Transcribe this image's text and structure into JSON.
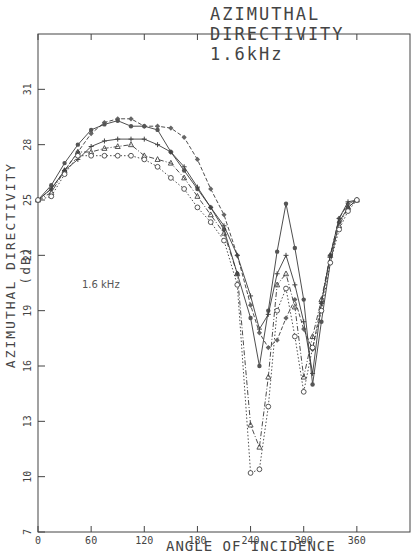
{
  "chart_data": {
    "type": "line",
    "title": "AZIMUTHAL DIRECTIVITY 1.6kHz",
    "xlabel": "ANGLE OF INCIDENCE",
    "ylabel": "AZIMUTHAL DIRECTIVITY (dB)",
    "annotation": "1.6 kHz",
    "xlim": [
      0,
      420
    ],
    "ylim": [
      7,
      34
    ],
    "x_ticks": [
      0,
      60,
      120,
      180,
      240,
      300,
      360
    ],
    "x_tick_labels": [
      "0",
      "60",
      "120",
      "180",
      "240",
      "300",
      "360"
    ],
    "y_ticks": [
      7,
      10,
      13,
      16,
      19,
      22,
      25,
      28,
      31
    ],
    "y_tick_labels": [
      "7",
      "10",
      "13",
      "16",
      "19",
      "22",
      "25",
      "28",
      "31"
    ],
    "grid": false,
    "legend": null,
    "x": [
      0,
      15,
      30,
      45,
      60,
      75,
      90,
      105,
      120,
      135,
      150,
      165,
      180,
      195,
      210,
      225,
      240,
      250,
      260,
      270,
      280,
      290,
      300,
      310,
      320,
      330,
      340,
      350,
      360
    ],
    "series": [
      {
        "name": "series-1 (dash, diamond)",
        "style": "dashed",
        "values": [
          25.0,
          25.6,
          26.6,
          27.6,
          28.6,
          29.2,
          29.4,
          29.4,
          29.0,
          29.0,
          28.9,
          28.4,
          27.2,
          25.6,
          24.2,
          22.0,
          19.3,
          17.8,
          17.0,
          17.4,
          18.6,
          19.6,
          18.0,
          16.9,
          19.4,
          22.0,
          24.0,
          24.8,
          25.0
        ]
      },
      {
        "name": "series-2 (solid, circle)",
        "style": "solid",
        "values": [
          25.0,
          25.8,
          27.0,
          28.0,
          28.8,
          29.1,
          29.3,
          29.0,
          29.0,
          28.8,
          27.6,
          26.6,
          25.6,
          24.6,
          23.4,
          21.0,
          18.6,
          16.0,
          19.0,
          22.2,
          24.8,
          22.4,
          19.6,
          15.0,
          18.4,
          21.6,
          23.8,
          24.6,
          25.0
        ]
      },
      {
        "name": "series-3 (solid, plus)",
        "style": "solid",
        "values": [
          25.0,
          25.6,
          26.6,
          27.2,
          27.9,
          28.2,
          28.3,
          28.3,
          28.3,
          28.0,
          27.6,
          26.8,
          25.7,
          24.6,
          23.6,
          22.0,
          19.8,
          18.0,
          18.8,
          21.0,
          22.0,
          20.4,
          18.4,
          15.6,
          19.4,
          22.0,
          24.0,
          24.9,
          25.0
        ]
      },
      {
        "name": "series-4 (dash-dot, triangle)",
        "style": "dashdot",
        "values": [
          25.0,
          25.4,
          26.6,
          27.6,
          27.6,
          27.8,
          27.9,
          28.0,
          27.4,
          27.2,
          27.0,
          26.2,
          25.2,
          24.2,
          23.2,
          21.0,
          12.8,
          11.6,
          15.4,
          20.4,
          21.0,
          19.2,
          15.4,
          17.6,
          19.6,
          22.0,
          23.6,
          24.6,
          25.0
        ]
      },
      {
        "name": "series-5 (dotted, open circle)",
        "style": "dotted",
        "values": [
          25.0,
          25.2,
          26.4,
          27.4,
          27.4,
          27.4,
          27.4,
          27.4,
          27.2,
          26.8,
          26.2,
          25.6,
          24.6,
          23.8,
          22.8,
          20.4,
          10.2,
          10.4,
          13.8,
          19.0,
          20.2,
          17.6,
          14.6,
          17.0,
          19.0,
          21.6,
          23.4,
          24.4,
          25.0
        ]
      }
    ]
  },
  "colors": {
    "line": "#3a3a3a",
    "axis": "#444444",
    "text": "#444444",
    "background": "#ffffff"
  }
}
